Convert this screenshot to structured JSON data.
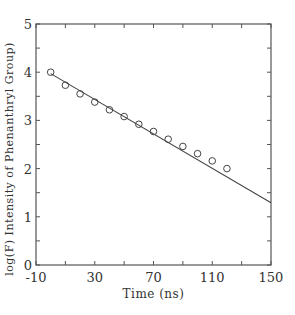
{
  "chart_data": {
    "type": "scatter",
    "title": "",
    "xlabel": "Time (ns)",
    "ylabel": "log(F)  Intensity of Phenanthryl Group)",
    "xlim": [
      -10,
      150
    ],
    "ylim": [
      0,
      5
    ],
    "x_major_ticks": [
      -10,
      30,
      70,
      110,
      150
    ],
    "x_minor_step": 20,
    "y_major_ticks": [
      0,
      1,
      2,
      3,
      4,
      5
    ],
    "y_minor_step": 0.5,
    "grid": false,
    "legend": null,
    "series": [
      {
        "name": "measured",
        "kind": "scatter",
        "marker": "open-circle",
        "x": [
          0,
          10,
          20,
          30,
          40,
          50,
          60,
          70,
          80,
          90,
          100,
          110,
          120
        ],
        "y": [
          4.0,
          3.73,
          3.55,
          3.38,
          3.22,
          3.08,
          2.92,
          2.77,
          2.61,
          2.46,
          2.31,
          2.16,
          2.0
        ]
      },
      {
        "name": "fit",
        "kind": "line",
        "x": [
          0,
          150
        ],
        "y": [
          3.97,
          1.29
        ]
      }
    ]
  },
  "colors": {
    "axis": "#555555",
    "marker": "#444444",
    "line": "#444444",
    "text": "#333333"
  }
}
